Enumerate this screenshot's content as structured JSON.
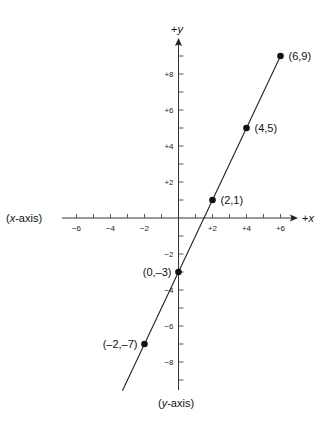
{
  "chart_data": {
    "type": "line",
    "title": "",
    "xlabel": "(x-axis)",
    "ylabel": "(y-axis)",
    "x_positive_label": "+x",
    "y_positive_label": "+y",
    "xlim": [
      -7,
      7
    ],
    "ylim": [
      -10,
      10
    ],
    "x_ticks": [
      "-6",
      "-4",
      "-2",
      "+2",
      "+4",
      "+6"
    ],
    "y_ticks": [
      "+8",
      "+6",
      "+4",
      "+2",
      "-2",
      "-4",
      "-6",
      "-8"
    ],
    "grid": false,
    "series": [
      {
        "name": "y = 2x - 3",
        "points": [
          {
            "x": -2,
            "y": -7,
            "label": "(–2,–7)"
          },
          {
            "x": 0,
            "y": -3,
            "label": "(0,–3)"
          },
          {
            "x": 2,
            "y": 1,
            "label": "(2,1)"
          },
          {
            "x": 4,
            "y": 5,
            "label": "(4,5)"
          },
          {
            "x": 6,
            "y": 9,
            "label": "(6,9)"
          }
        ]
      }
    ]
  },
  "labels": {
    "x_axis_name_prefix": "x",
    "x_axis_name_suffix": "-axis",
    "y_axis_name_prefix": "y",
    "y_axis_name_suffix": "-axis",
    "plus": "+",
    "x_letter": "x",
    "y_letter": "y",
    "open_paren": "(",
    "close_paren": ")"
  }
}
